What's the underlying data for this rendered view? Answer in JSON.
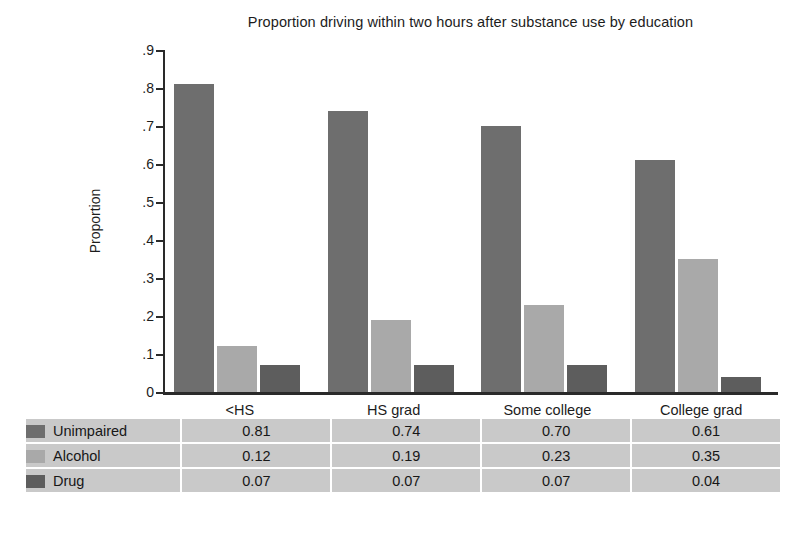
{
  "chart_data": {
    "type": "bar",
    "title": "Proportion driving within two hours after substance use by education",
    "xlabel": "",
    "ylabel": "Proportion",
    "categories": [
      "<HS",
      "HS grad",
      "Some college",
      "College grad"
    ],
    "series": [
      {
        "name": "Unimpaired",
        "color": "#6e6e6e",
        "values": [
          0.81,
          0.74,
          0.7,
          0.61
        ]
      },
      {
        "name": "Alcohol",
        "color": "#a9a9a9",
        "values": [
          0.12,
          0.19,
          0.23,
          0.35
        ]
      },
      {
        "name": "Drug",
        "color": "#5d5d5d",
        "values": [
          0.07,
          0.07,
          0.07,
          0.04
        ]
      }
    ],
    "ylim": [
      0,
      0.9
    ],
    "ytick_labels": [
      "0",
      ".1",
      ".2",
      ".3",
      ".4",
      ".5",
      ".6",
      ".7",
      ".8",
      ".9"
    ],
    "ytick_values": [
      0,
      0.1,
      0.2,
      0.3,
      0.4,
      0.5,
      0.6,
      0.7,
      0.8,
      0.9
    ],
    "grid": false,
    "legend_position": "table-below",
    "table": {
      "rows": [
        {
          "label": "Unimpaired",
          "values": [
            "0.81",
            "0.74",
            "0.70",
            "0.61"
          ]
        },
        {
          "label": "Alcohol",
          "values": [
            "0.12",
            "0.19",
            "0.23",
            "0.35"
          ]
        },
        {
          "label": "Drug",
          "values": [
            "0.07",
            "0.07",
            "0.07",
            "0.04"
          ]
        }
      ]
    }
  },
  "colors": {
    "axis": "#2a2a2a",
    "text": "#1c1c1c",
    "table_background": "#c9c9c9",
    "table_gridline": "#ffffff",
    "page_background": "#ffffff"
  }
}
